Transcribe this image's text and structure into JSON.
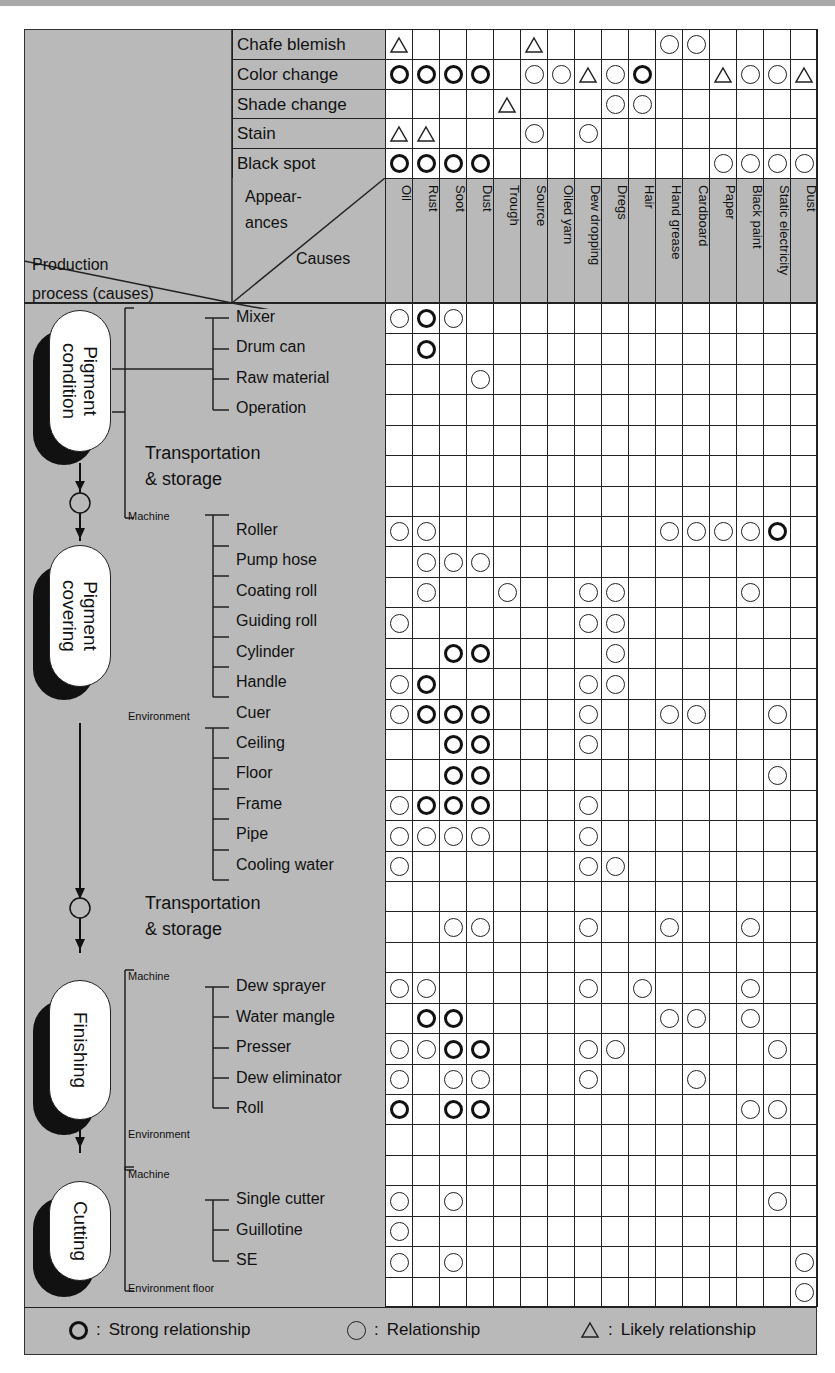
{
  "chart_data": {
    "type": "table",
    "legend": [
      {
        "symbol": "strong",
        "label": "Strong relationship"
      },
      {
        "symbol": "rel",
        "label": "Relationship"
      },
      {
        "symbol": "likely",
        "label": "Likely relationship"
      }
    ],
    "corner": {
      "appearances": "Appear-ances",
      "causes": "Causes",
      "process": "Production process (causes)"
    },
    "causes": [
      "Oil",
      "Rust",
      "Soot",
      "Dust",
      "Trough",
      "Source",
      "Oiled yarn",
      "Dew dropping",
      "Dregs",
      "Hair",
      "Hand grease",
      "Cardboard",
      "Paper",
      "Black paint",
      "Static electricity",
      "Dust"
    ],
    "appearances": [
      {
        "label": "Chafe blemish",
        "marks": {
          "1": "likely",
          "6": "likely",
          "11": "rel",
          "12": "rel"
        }
      },
      {
        "label": "Color change",
        "marks": {
          "1": "strong",
          "2": "strong",
          "3": "strong",
          "4": "strong",
          "6": "rel",
          "7": "rel",
          "8": "likely",
          "9": "rel",
          "10": "strong",
          "13": "likely",
          "14": "rel",
          "15": "rel",
          "16": "likely"
        }
      },
      {
        "label": "Shade change",
        "marks": {
          "5": "likely",
          "9": "rel",
          "10": "rel"
        }
      },
      {
        "label": "Stain",
        "marks": {
          "1": "likely",
          "2": "likely",
          "6": "rel",
          "8": "rel"
        }
      },
      {
        "label": "Black spot",
        "marks": {
          "1": "strong",
          "2": "strong",
          "3": "strong",
          "4": "strong",
          "13": "rel",
          "14": "rel",
          "15": "rel",
          "16": "rel"
        }
      }
    ],
    "process_rows": [
      {
        "label": "Mixer",
        "marks": {
          "1": "rel",
          "2": "strong",
          "3": "rel"
        }
      },
      {
        "label": "Drum can",
        "marks": {
          "2": "strong"
        }
      },
      {
        "label": "Raw material",
        "marks": {
          "4": "rel"
        }
      },
      {
        "label": "Operation",
        "marks": {}
      },
      {
        "label": "",
        "marks": {}
      },
      {
        "label": "",
        "marks": {}
      },
      {
        "label": "",
        "marks": {}
      },
      {
        "label": "Roller",
        "marks": {
          "1": "rel",
          "2": "rel",
          "11": "rel",
          "12": "rel",
          "13": "rel",
          "14": "rel",
          "15": "strong"
        }
      },
      {
        "label": "Pump hose",
        "marks": {
          "2": "rel",
          "3": "rel",
          "4": "rel"
        }
      },
      {
        "label": "Coating roll",
        "marks": {
          "2": "rel",
          "5": "rel",
          "8": "rel",
          "9": "rel",
          "14": "rel"
        }
      },
      {
        "label": "Guiding roll",
        "marks": {
          "1": "rel",
          "8": "rel",
          "9": "rel"
        }
      },
      {
        "label": "Cylinder",
        "marks": {
          "3": "strong",
          "4": "strong",
          "9": "rel"
        }
      },
      {
        "label": "Handle",
        "marks": {
          "1": "rel",
          "2": "strong",
          "8": "rel",
          "9": "rel"
        }
      },
      {
        "label": "Cuer",
        "marks": {
          "1": "rel",
          "2": "strong",
          "3": "strong",
          "4": "strong",
          "8": "rel",
          "11": "rel",
          "12": "rel",
          "15": "rel"
        }
      },
      {
        "label": "Ceiling",
        "marks": {
          "3": "strong",
          "4": "strong",
          "8": "rel"
        }
      },
      {
        "label": "Floor",
        "marks": {
          "3": "strong",
          "4": "strong",
          "15": "rel"
        }
      },
      {
        "label": "Frame",
        "marks": {
          "1": "rel",
          "2": "strong",
          "3": "strong",
          "4": "strong",
          "8": "rel"
        }
      },
      {
        "label": "Pipe",
        "marks": {
          "1": "rel",
          "2": "rel",
          "3": "rel",
          "4": "rel",
          "8": "rel"
        }
      },
      {
        "label": "Cooling water",
        "marks": {
          "1": "rel",
          "8": "rel",
          "9": "rel"
        }
      },
      {
        "label": "",
        "marks": {}
      },
      {
        "label": "Transportation & storage",
        "marks": {
          "3": "rel",
          "4": "rel",
          "8": "rel",
          "11": "rel",
          "14": "rel"
        }
      },
      {
        "label": "",
        "marks": {}
      },
      {
        "label": "Dew sprayer",
        "marks": {
          "1": "rel",
          "2": "rel",
          "8": "rel",
          "10": "rel",
          "14": "rel"
        }
      },
      {
        "label": "Water mangle",
        "marks": {
          "2": "strong",
          "3": "strong",
          "11": "rel",
          "12": "rel",
          "14": "rel"
        }
      },
      {
        "label": "Presser",
        "marks": {
          "1": "rel",
          "2": "rel",
          "3": "strong",
          "4": "strong",
          "8": "rel",
          "9": "rel",
          "15": "rel"
        }
      },
      {
        "label": "Dew eliminator",
        "marks": {
          "1": "rel",
          "3": "rel",
          "4": "rel",
          "8": "rel",
          "12": "rel"
        }
      },
      {
        "label": "Roll",
        "marks": {
          "1": "strong",
          "3": "strong",
          "4": "strong",
          "14": "rel",
          "15": "rel"
        }
      },
      {
        "label": "",
        "marks": {}
      },
      {
        "label": "",
        "marks": {}
      },
      {
        "label": "Single cutter",
        "marks": {
          "1": "rel",
          "3": "rel",
          "15": "rel"
        }
      },
      {
        "label": "Guillotine",
        "marks": {
          "1": "rel"
        }
      },
      {
        "label": "SE",
        "marks": {
          "1": "rel",
          "3": "rel",
          "16": "rel"
        }
      },
      {
        "label": "Environment floor",
        "marks": {
          "16": "rel"
        }
      }
    ]
  },
  "stages": [
    {
      "label": "Pigment\ncondition",
      "line1": "Pigment",
      "line2": "condition"
    },
    {
      "label": "Pigment\ncovering",
      "line1": "Pigment",
      "line2": "covering"
    },
    {
      "label": "Finishing",
      "line1": "Finishing",
      "line2": ""
    },
    {
      "label": "Cutting",
      "line1": "Cutting",
      "line2": ""
    }
  ],
  "transport": {
    "line1": "Transportation",
    "line2": "& storage"
  },
  "groups": {
    "machine": "Machine",
    "environment": "Environment",
    "environment_floor": "Environment floor"
  },
  "corner": {
    "appear1": "Appear-",
    "appear2": "ances",
    "causes": "Causes",
    "process1": "Production",
    "process2": "process (causes)"
  },
  "legend": {
    "strong": "Strong relationship",
    "rel": "Relationship",
    "likely": "Likely relationship",
    "sep": ":"
  },
  "colors": {
    "panel": "#b9b9b9",
    "grid": "#222222",
    "cell": "#ffffff",
    "shadow": "#111111"
  }
}
